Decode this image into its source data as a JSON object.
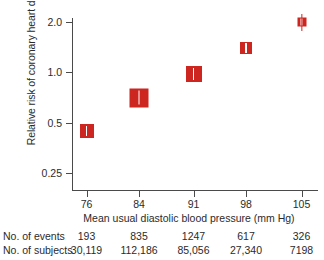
{
  "chart_data": {
    "type": "scatter",
    "title": "",
    "xlabel": "Mean usual diastolic blood pressure (mm Hg)",
    "ylabel": "Relative risk of coronary heart disease",
    "yscale": "log",
    "ylim": [
      0.22,
      2.3
    ],
    "yticks": [
      0.25,
      0.5,
      1.0,
      2.0
    ],
    "ytick_labels": [
      "0.25",
      "0.5",
      "1.0",
      "2.0"
    ],
    "x": [
      76,
      84,
      91,
      98,
      105
    ],
    "xtick_labels": [
      "76",
      "84",
      "91",
      "98",
      "105"
    ],
    "values": [
      0.49,
      0.78,
      1.04,
      1.5,
      2.02
    ],
    "marker_color": "#cd2520",
    "grid": false,
    "legend": null,
    "series": [
      {
        "name": "Relative risk of coronary heart disease",
        "values": [
          0.49,
          0.78,
          1.04,
          1.5,
          2.02
        ]
      }
    ],
    "points": [
      {
        "x": "76",
        "y": 0.49,
        "box_px": 14,
        "cx": 86.5,
        "cy": 131.0
      },
      {
        "x": "84",
        "y": 0.78,
        "box_px": 19,
        "cx": 139.0,
        "cy": 97.5
      },
      {
        "x": "91",
        "y": 1.04,
        "box_px": 16,
        "cx": 193.5,
        "cy": 74.0
      },
      {
        "x": "98",
        "y": 1.5,
        "box_px": 12,
        "cx": 246.0,
        "cy": 48.0
      },
      {
        "x": "105",
        "y": 2.02,
        "box_px": 9,
        "cx": 301.5,
        "cy": 22.0
      }
    ]
  },
  "stats_table": {
    "rows": [
      {
        "label": "No. of events",
        "cells": [
          "193",
          "835",
          "1247",
          "617",
          "326"
        ]
      },
      {
        "label": "No. of subjects",
        "cells": [
          "30,119",
          "112,186",
          "85,056",
          "27,340",
          "7198"
        ]
      }
    ]
  }
}
